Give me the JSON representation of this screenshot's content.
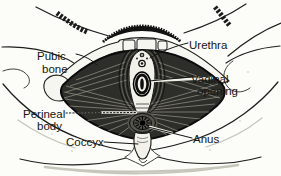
{
  "labels": {
    "pubic_bone": {
      "line1": "Pubic",
      "line2": "bone"
    },
    "urethra": "Urethra",
    "vaginal_opening": {
      "line1": "Vaginal",
      "line2": "opening"
    },
    "perineal_body": {
      "line1": "Perineal",
      "line2": "body"
    },
    "coccyx": "Coccyx",
    "anus": "Anus"
  },
  "colors": {
    "background": "#fcfcf8",
    "ink": "#1a1a1a",
    "muscle": "#2d2d29",
    "striation": "#98988c",
    "skin": "#f4f4ec"
  }
}
